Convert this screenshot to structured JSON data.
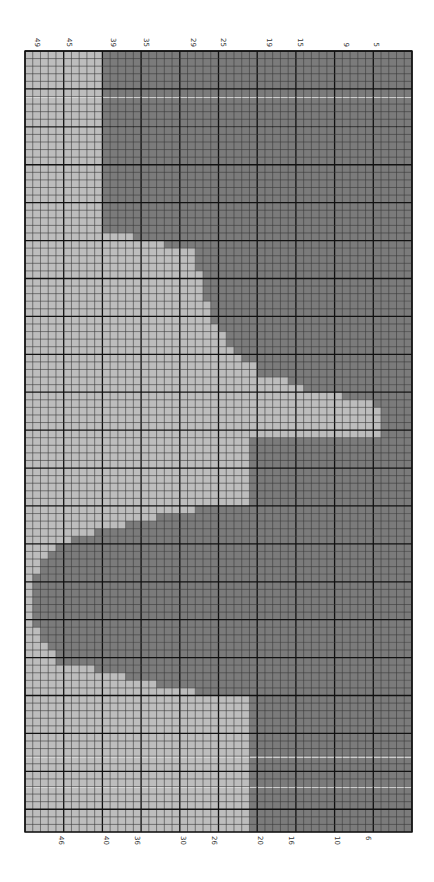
{
  "chart_data": {
    "type": "heatmap",
    "title": "",
    "grid": {
      "columns": 50,
      "rows": 103,
      "major_every": 5,
      "x0": 25,
      "y0": 51,
      "x1": 412,
      "y1": 832
    },
    "colors": {
      "light": "#bdbdbd",
      "dark": "#7b7b7b",
      "grid_minor": "#3a3a3a",
      "grid_major": "#111111",
      "stripe": "#d9d9d9",
      "label": "#333333"
    },
    "legend": [
      {
        "name": "Color A (light)",
        "color": "#bdbdbd"
      },
      {
        "name": "Color B (dark)",
        "color": "#7b7b7b"
      }
    ],
    "row_runs": [
      {
        "count": 24,
        "light_to_col": 9
      },
      {
        "count": 1,
        "light_to_col": 13
      },
      {
        "count": 1,
        "light_to_col": 17
      },
      {
        "count": 3,
        "light_to_col": 21
      },
      {
        "count": 4,
        "light_to_col": 22
      },
      {
        "count": 3,
        "light_to_col": 23
      },
      {
        "count": 1,
        "light_to_col": 24
      },
      {
        "count": 2,
        "light_to_col": 25
      },
      {
        "count": 1,
        "light_to_col": 26
      },
      {
        "count": 1,
        "light_to_col": 27
      },
      {
        "count": 2,
        "light_to_col": 29
      },
      {
        "count": 1,
        "light_to_col": 33
      },
      {
        "count": 1,
        "light_to_col": 35
      },
      {
        "count": 1,
        "light_to_col": 40
      },
      {
        "count": 1,
        "light_to_col": 44
      },
      {
        "count": 4,
        "light_to_col": 45
      },
      {
        "count": 9,
        "light_to_col": 28
      },
      {
        "count": 1,
        "light_to_col": 21
      },
      {
        "count": 1,
        "light_to_col": 16
      },
      {
        "count": 1,
        "light_to_col": 12
      },
      {
        "count": 1,
        "light_to_col": 8
      },
      {
        "count": 1,
        "light_to_col": 5
      },
      {
        "count": 1,
        "light_to_col": 3
      },
      {
        "count": 1,
        "light_to_col": 2
      },
      {
        "count": 2,
        "light_to_col": 1
      },
      {
        "count": 7,
        "light_to_col": 0
      },
      {
        "count": 2,
        "light_to_col": 1
      },
      {
        "count": 1,
        "light_to_col": 2
      },
      {
        "count": 2,
        "light_to_col": 3
      },
      {
        "count": 1,
        "light_to_col": 8
      },
      {
        "count": 1,
        "light_to_col": 12
      },
      {
        "count": 1,
        "light_to_col": 16
      },
      {
        "count": 1,
        "light_to_col": 21
      },
      {
        "count": 18,
        "light_to_col": 28
      }
    ],
    "stripes_y": [
      97,
      127,
      757,
      787
    ],
    "top_labels": [
      {
        "text": "49",
        "x": 37
      },
      {
        "text": "45",
        "x": 69
      },
      {
        "text": "39",
        "x": 113
      },
      {
        "text": "35",
        "x": 146
      },
      {
        "text": "29",
        "x": 193
      },
      {
        "text": "25",
        "x": 223
      },
      {
        "text": "19",
        "x": 269
      },
      {
        "text": "15",
        "x": 300
      },
      {
        "text": "9",
        "x": 346
      },
      {
        "text": "5",
        "x": 376
      }
    ],
    "bottom_labels": [
      {
        "text": "46",
        "x": 61
      },
      {
        "text": "40",
        "x": 106
      },
      {
        "text": "36",
        "x": 137
      },
      {
        "text": "30",
        "x": 183
      },
      {
        "text": "26",
        "x": 214
      },
      {
        "text": "20",
        "x": 260
      },
      {
        "text": "16",
        "x": 291
      },
      {
        "text": "10",
        "x": 337
      },
      {
        "text": "6",
        "x": 368
      }
    ]
  }
}
